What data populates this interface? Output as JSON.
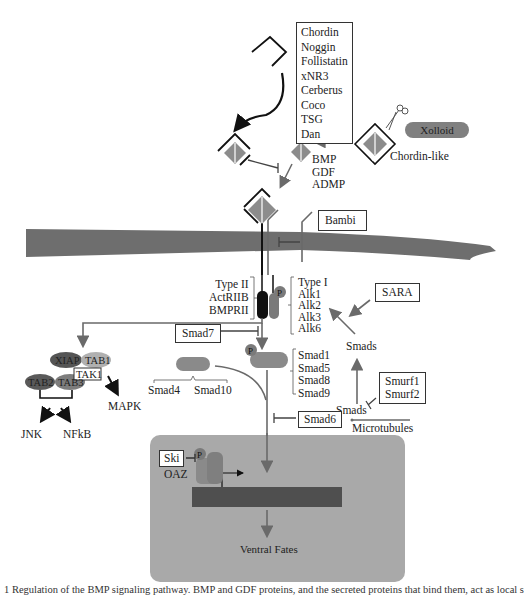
{
  "diagram": {
    "title": "Regulation of the BMP signaling pathway",
    "antagonists_box": [
      "Chordin",
      "Noggin",
      "Follistatin",
      "xNR3",
      "Cerberus",
      "Coco",
      "TSG",
      "Dan"
    ],
    "xolloid": "Xolloid",
    "chordin_like": "Chordin-like",
    "ligands": [
      "BMP",
      "GDF",
      "ADMP"
    ],
    "bambi": "Bambi",
    "type2_receptors": [
      "Type II",
      "ActRIIB",
      "BMPRII"
    ],
    "type1_receptors": [
      "Type I",
      "Alk1",
      "Alk2",
      "Alk3",
      "Alk6"
    ],
    "phospho": "P",
    "sara": "SARA",
    "smads_upper": "Smads",
    "smads_lower": "Smads",
    "smurfs": [
      "Smurf1",
      "Smurf2"
    ],
    "microtubules": "Microtubules",
    "smad7": "Smad7",
    "smad6": "Smad6",
    "r_smads": [
      "Smad1",
      "Smad5",
      "Smad8",
      "Smad9"
    ],
    "co_smads": [
      "Smad4",
      "Smad10"
    ],
    "tak_complex": {
      "xiap": "XIAP",
      "tab1": "TAB1",
      "tak1": "TAK1",
      "tab2": "TAB2",
      "tab3": "TAB3"
    },
    "mapk": "MAPK",
    "jnk": "JNK",
    "nfkb": "NFkB",
    "nucleus": {
      "ski": "Ski",
      "oaz": "OAZ",
      "output": "Ventral Fates"
    },
    "colors": {
      "membrane": "#6e6e6e",
      "nucleus_bg": "#a9a9a9",
      "dna": "#4f4f4f",
      "arrow_gray": "#6a6a6a",
      "smad_fill": "#8a8a8a",
      "ligand_fill": "#8c8c8c",
      "xiap": "#555555",
      "tab1": "#b0b0b0",
      "tab2": "#5a5a5a",
      "tab3": "#7d7d7d",
      "xolloid": "#808080"
    }
  },
  "caption": "1  Regulation of the BMP signaling pathway. BMP and GDF proteins, and the secreted proteins that bind them, act as local signals in the establishment of the dorsal-ventral axis"
}
